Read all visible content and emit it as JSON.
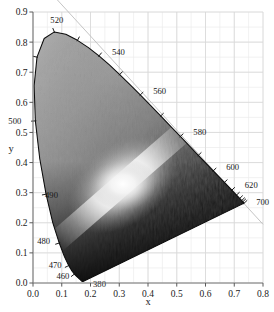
{
  "figure": {
    "kind": "cie-1931-chromaticity-diagram",
    "rendering": "grayscale",
    "background_color": "#ffffff",
    "grid_color": "#d8d8d8",
    "minor_grid_color": "#ebebeb",
    "axis_color": "#808080",
    "locus_color": "#101010",
    "alychne_color": "#c0c0c0"
  },
  "axes": {
    "x": {
      "label": "x",
      "min": 0.0,
      "max": 0.8,
      "ticks": [
        "0.0",
        "0.1",
        "0.2",
        "0.3",
        "0.4",
        "0.5",
        "0.6",
        "0.7",
        "0.8"
      ],
      "tick_values": [
        0.0,
        0.1,
        0.2,
        0.3,
        0.4,
        0.5,
        0.6,
        0.7,
        0.8
      ],
      "minor_step": 0.05
    },
    "y": {
      "label": "y",
      "min": 0.0,
      "max": 0.9,
      "ticks": [
        "0.0",
        "0.1",
        "0.2",
        "0.3",
        "0.4",
        "0.5",
        "0.6",
        "0.7",
        "0.8",
        "0.9"
      ],
      "tick_values": [
        0.0,
        0.1,
        0.2,
        0.3,
        0.4,
        0.5,
        0.6,
        0.7,
        0.8,
        0.9
      ],
      "minor_step": 0.05
    }
  },
  "chart_data": {
    "type": "scatter",
    "title": "",
    "subtitle": "",
    "xlabel": "x",
    "ylabel": "y",
    "xlim": [
      0.0,
      0.8
    ],
    "ylim": [
      0.0,
      0.9
    ],
    "grid": true,
    "legend": "none",
    "annotations": [
      {
        "label": "380",
        "x": 0.1741,
        "y": 0.005,
        "text_dx": 10,
        "text_dy": 6
      },
      {
        "label": "460",
        "x": 0.1441,
        "y": 0.0297,
        "text_dx": -18,
        "text_dy": 5
      },
      {
        "label": "470",
        "x": 0.1241,
        "y": 0.0578,
        "text_dx": -20,
        "text_dy": 2
      },
      {
        "label": "480",
        "x": 0.0913,
        "y": 0.1327,
        "text_dx": -22,
        "text_dy": 1
      },
      {
        "label": "490",
        "x": 0.0454,
        "y": 0.295,
        "text_dx": -1,
        "text_dy": 4
      },
      {
        "label": "500",
        "x": 0.0082,
        "y": 0.5384,
        "text_dx": -27,
        "text_dy": 3
      },
      {
        "label": "520",
        "x": 0.0743,
        "y": 0.8338,
        "text_dx": -4,
        "text_dy": -9
      },
      {
        "label": "540",
        "x": 0.2296,
        "y": 0.7543,
        "text_dx": 13,
        "text_dy": -1
      },
      {
        "label": "560",
        "x": 0.3731,
        "y": 0.6245,
        "text_dx": 13,
        "text_dy": -1
      },
      {
        "label": "580",
        "x": 0.5125,
        "y": 0.4866,
        "text_dx": 13,
        "text_dy": -1
      },
      {
        "label": "600",
        "x": 0.627,
        "y": 0.3725,
        "text_dx": 13,
        "text_dy": -1
      },
      {
        "label": "620",
        "x": 0.6915,
        "y": 0.3083,
        "text_dx": 13,
        "text_dy": -2
      },
      {
        "label": "700",
        "x": 0.7347,
        "y": 0.2653,
        "text_dx": 12,
        "text_dy": 2
      }
    ],
    "spectral_locus": [
      [
        0.1741,
        0.005
      ],
      [
        0.174,
        0.005
      ],
      [
        0.1738,
        0.0049
      ],
      [
        0.1736,
        0.0049
      ],
      [
        0.1733,
        0.0048
      ],
      [
        0.173,
        0.0048
      ],
      [
        0.1726,
        0.0048
      ],
      [
        0.1721,
        0.0048
      ],
      [
        0.1714,
        0.0051
      ],
      [
        0.1703,
        0.0058
      ],
      [
        0.1689,
        0.0069
      ],
      [
        0.1669,
        0.0086
      ],
      [
        0.1644,
        0.0109
      ],
      [
        0.1611,
        0.0138
      ],
      [
        0.1566,
        0.0177
      ],
      [
        0.151,
        0.0227
      ],
      [
        0.144,
        0.0297
      ],
      [
        0.1355,
        0.0399
      ],
      [
        0.1241,
        0.0578
      ],
      [
        0.1096,
        0.0868
      ],
      [
        0.0913,
        0.1327
      ],
      [
        0.0687,
        0.2007
      ],
      [
        0.0454,
        0.295
      ],
      [
        0.0235,
        0.4127
      ],
      [
        0.0082,
        0.5384
      ],
      [
        0.0039,
        0.6548
      ],
      [
        0.0139,
        0.7502
      ],
      [
        0.0389,
        0.812
      ],
      [
        0.0743,
        0.8338
      ],
      [
        0.1142,
        0.8262
      ],
      [
        0.1547,
        0.8059
      ],
      [
        0.1929,
        0.7816
      ],
      [
        0.2296,
        0.7543
      ],
      [
        0.2658,
        0.7243
      ],
      [
        0.3016,
        0.6923
      ],
      [
        0.3373,
        0.6589
      ],
      [
        0.3731,
        0.6245
      ],
      [
        0.4087,
        0.5896
      ],
      [
        0.4441,
        0.5547
      ],
      [
        0.4788,
        0.5202
      ],
      [
        0.5125,
        0.4866
      ],
      [
        0.5448,
        0.4544
      ],
      [
        0.5752,
        0.4242
      ],
      [
        0.6029,
        0.3965
      ],
      [
        0.627,
        0.3725
      ],
      [
        0.6482,
        0.3514
      ],
      [
        0.6658,
        0.334
      ],
      [
        0.6801,
        0.3197
      ],
      [
        0.6915,
        0.3083
      ],
      [
        0.7006,
        0.2993
      ],
      [
        0.7079,
        0.292
      ],
      [
        0.714,
        0.2859
      ],
      [
        0.719,
        0.2809
      ],
      [
        0.723,
        0.277
      ],
      [
        0.726,
        0.274
      ],
      [
        0.7283,
        0.2717
      ],
      [
        0.73,
        0.27
      ],
      [
        0.7311,
        0.2689
      ],
      [
        0.732,
        0.268
      ],
      [
        0.7327,
        0.2673
      ],
      [
        0.7334,
        0.2666
      ],
      [
        0.734,
        0.266
      ],
      [
        0.7344,
        0.2656
      ],
      [
        0.7346,
        0.2654
      ],
      [
        0.7347,
        0.2653
      ]
    ],
    "purple_line": [
      [
        0.7347,
        0.2653
      ],
      [
        0.1741,
        0.005
      ]
    ],
    "white_point": {
      "x": 0.3127,
      "y": 0.329
    },
    "locus_ticks_nm": [
      460,
      470,
      480,
      490,
      500,
      510,
      520,
      530,
      540,
      550,
      560,
      570,
      580,
      590,
      600,
      610,
      620,
      630,
      640,
      650,
      660,
      700
    ]
  }
}
